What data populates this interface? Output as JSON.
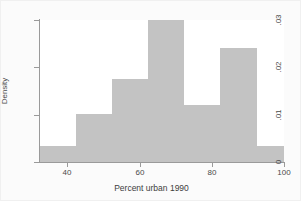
{
  "chart_data": {
    "type": "bar",
    "subtype": "histogram",
    "title": "",
    "xlabel": "Percent urban 1990",
    "ylabel": "Density",
    "xlim": [
      32.4,
      100.0
    ],
    "ylim": [
      0,
      0.03
    ],
    "grid": false,
    "legend": null,
    "bar_color": "#c3c3c3",
    "background_color": "#ffffff",
    "figure_background_color": "#fbfbfb",
    "axis_color": "#9a9a9a",
    "text_color": "#4a4a4a",
    "xticks": [
      40,
      60,
      80,
      100
    ],
    "xtick_labels": [
      "40",
      "60",
      "80",
      "100"
    ],
    "yticks": [
      0,
      0.01,
      0.02,
      0.03
    ],
    "ytick_labels": [
      "0",
      ".01",
      ".02",
      ".03"
    ],
    "bin_edges": [
      32.4,
      42.4,
      52.4,
      62.4,
      72.4,
      82.4,
      92.4,
      100.0
    ],
    "bins": [
      {
        "left": 32.4,
        "right": 42.4,
        "density": 0.0034
      },
      {
        "left": 42.4,
        "right": 52.4,
        "density": 0.0102
      },
      {
        "left": 52.4,
        "right": 62.4,
        "density": 0.0176
      },
      {
        "left": 62.4,
        "right": 72.4,
        "density": 0.03
      },
      {
        "left": 72.4,
        "right": 82.4,
        "density": 0.012
      },
      {
        "left": 82.4,
        "right": 92.4,
        "density": 0.024
      },
      {
        "left": 92.4,
        "right": 100.0,
        "density": 0.0034
      }
    ],
    "categories": [
      "32.4-42.4",
      "42.4-52.4",
      "52.4-62.4",
      "62.4-72.4",
      "72.4-82.4",
      "82.4-92.4",
      "92.4-100"
    ],
    "values": [
      0.0034,
      0.0102,
      0.0176,
      0.03,
      0.012,
      0.024,
      0.0034
    ]
  }
}
